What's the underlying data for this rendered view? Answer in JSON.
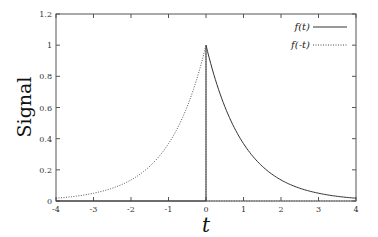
{
  "chart_data": {
    "type": "line",
    "title": "",
    "xlabel": "t",
    "ylabel": "Signal",
    "xlim": [
      -4,
      4
    ],
    "ylim": [
      0,
      1.2
    ],
    "xticks": [
      "-4",
      "-3",
      "-2",
      "-1",
      "0",
      "1",
      "2",
      "3",
      "4"
    ],
    "yticks": [
      "0",
      "0.2",
      "0.4",
      "0.6",
      "0.8",
      "1",
      "1.2"
    ],
    "grid": false,
    "legend_position": "top-right",
    "series": [
      {
        "name": "f(t)",
        "style": "solid",
        "formula": "exp(-t) for t>=0, 0 for t<0",
        "x": [
          -4,
          0,
          0,
          0.5,
          1,
          1.5,
          2,
          2.5,
          3,
          3.5,
          4
        ],
        "y": [
          0,
          0,
          1,
          0.607,
          0.368,
          0.223,
          0.135,
          0.082,
          0.05,
          0.03,
          0.018
        ]
      },
      {
        "name": "f(-t)",
        "style": "dotted",
        "formula": "exp(t) for t<=0, 0 for t>0",
        "x": [
          -4,
          -3.5,
          -3,
          -2.5,
          -2,
          -1.5,
          -1,
          -0.5,
          0,
          0,
          4
        ],
        "y": [
          0.018,
          0.03,
          0.05,
          0.082,
          0.135,
          0.223,
          0.368,
          0.607,
          1,
          0,
          0
        ]
      }
    ]
  }
}
